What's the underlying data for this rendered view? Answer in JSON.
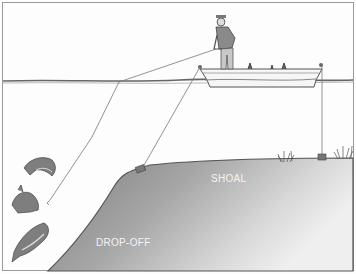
{
  "illustration": {
    "description": "Angler in a boat fishing lines over an underwater drop-off and shoal",
    "labels": {
      "shoal": "SHOAL",
      "drop_off": "DROP-OFF"
    },
    "colors": {
      "background": "#fdfdfd",
      "bottom_dark": "#8a8a8a",
      "bottom_light": "#e6e6e6",
      "line": "#777777",
      "border": "#9a9a9a"
    },
    "elements": [
      "angler",
      "boat",
      "fishing-line",
      "anchor-line-front",
      "anchor-line-rear",
      "sinker-front",
      "sinker-rear",
      "fish-1",
      "fish-2",
      "fish-3",
      "weeds-1",
      "weeds-2",
      "water-surface"
    ]
  }
}
